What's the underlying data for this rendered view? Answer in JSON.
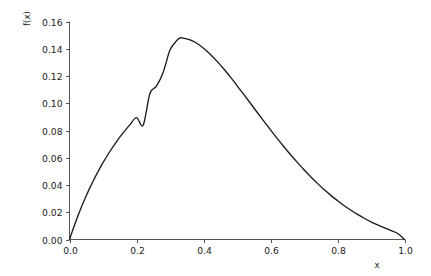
{
  "chart_data": {
    "type": "line",
    "title": "",
    "subtitle": "",
    "xlabel": "x",
    "ylabel": "f(x)",
    "xlim": [
      0.0,
      1.0
    ],
    "ylim": [
      0.0,
      0.16
    ],
    "grid": false,
    "legend": null,
    "legend_position": "none",
    "line_color": "#1c1c1c",
    "axis_color": "#555555",
    "background_color": "#ffffff",
    "xticks": [
      0.0,
      0.2,
      0.4,
      0.6,
      0.8,
      1.0
    ],
    "xtick_labels": [
      "0.0",
      "0.2",
      "0.4",
      "0.6",
      "0.8",
      "1.0"
    ],
    "yticks": [
      0.0,
      0.02,
      0.04,
      0.06,
      0.08,
      0.1,
      0.12,
      0.14,
      0.16
    ],
    "ytick_labels": [
      "0.00",
      "0.02",
      "0.04",
      "0.06",
      "0.08",
      "0.10",
      "0.12",
      "0.14",
      "0.16"
    ],
    "peak": {
      "x": 0.33,
      "y": 0.148
    },
    "series": [
      {
        "name": "f(x)",
        "x": [
          0.0,
          0.01,
          0.02,
          0.03,
          0.04,
          0.05,
          0.06,
          0.07,
          0.08,
          0.09,
          0.1,
          0.12,
          0.14,
          0.16,
          0.18,
          0.2,
          0.22,
          0.24,
          0.26,
          0.28,
          0.3,
          0.32,
          0.33,
          0.34,
          0.36,
          0.38,
          0.4,
          0.42,
          0.44,
          0.46,
          0.48,
          0.5,
          0.52,
          0.54,
          0.56,
          0.58,
          0.6,
          0.62,
          0.64,
          0.66,
          0.68,
          0.7,
          0.72,
          0.74,
          0.76,
          0.78,
          0.8,
          0.82,
          0.84,
          0.86,
          0.88,
          0.9,
          0.92,
          0.94,
          0.96,
          0.98,
          1.0
        ],
        "y": [
          0.0,
          0.0072,
          0.014,
          0.0204,
          0.0264,
          0.0321,
          0.0375,
          0.0426,
          0.0474,
          0.052,
          0.0564,
          0.0644,
          0.0717,
          0.0782,
          0.0841,
          0.0894,
          0.084,
          0.1072,
          0.1127,
          0.123,
          0.139,
          0.146,
          0.148,
          0.1478,
          0.1465,
          0.144,
          0.1404,
          0.136,
          0.1309,
          0.1253,
          0.1193,
          0.113,
          0.1065,
          0.1,
          0.0934,
          0.0869,
          0.0805,
          0.0742,
          0.0681,
          0.0622,
          0.0566,
          0.0512,
          0.0461,
          0.0412,
          0.0367,
          0.0324,
          0.0285,
          0.0248,
          0.0215,
          0.0184,
          0.0156,
          0.013,
          0.0107,
          0.0086,
          0.0066,
          0.0044,
          0.0
        ]
      }
    ]
  }
}
